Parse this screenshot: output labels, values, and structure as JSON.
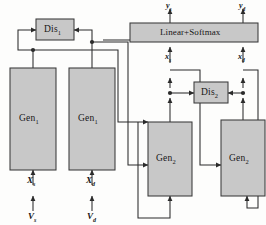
{
  "figure": {
    "type": "architecture-block-diagram",
    "background_color": "#fdfdfc",
    "box_fill_color": "#c8c8c8",
    "box_stroke_color": "#3a3a3a",
    "wire_color": "#2b2b2b"
  },
  "blocks": {
    "dis1": {
      "label": "Dis",
      "sub": "1"
    },
    "dis2": {
      "label": "Dis",
      "sub": "2"
    },
    "gen1_left": {
      "label": "Gen",
      "sub": "1"
    },
    "gen1_right": {
      "label": "Gen",
      "sub": "1"
    },
    "gen2_left": {
      "label": "Gen",
      "sub": "2"
    },
    "gen2_right": {
      "label": "Gen",
      "sub": "2"
    },
    "classifier": {
      "label": "Linear+Softmax"
    }
  },
  "signals": {
    "y_s": {
      "name": "y",
      "sub": "s"
    },
    "y_d": {
      "name": "y",
      "sub": "d"
    },
    "x_s_mid": {
      "name": "x",
      "sub": "s"
    },
    "x_d_mid": {
      "name": "x",
      "sub": "d"
    },
    "X_s": {
      "name": "X",
      "sub": "s"
    },
    "X_d": {
      "name": "X",
      "sub": "d"
    },
    "V_s": {
      "name": "V",
      "sub": "s"
    },
    "V_d": {
      "name": "V",
      "sub": "d"
    }
  }
}
